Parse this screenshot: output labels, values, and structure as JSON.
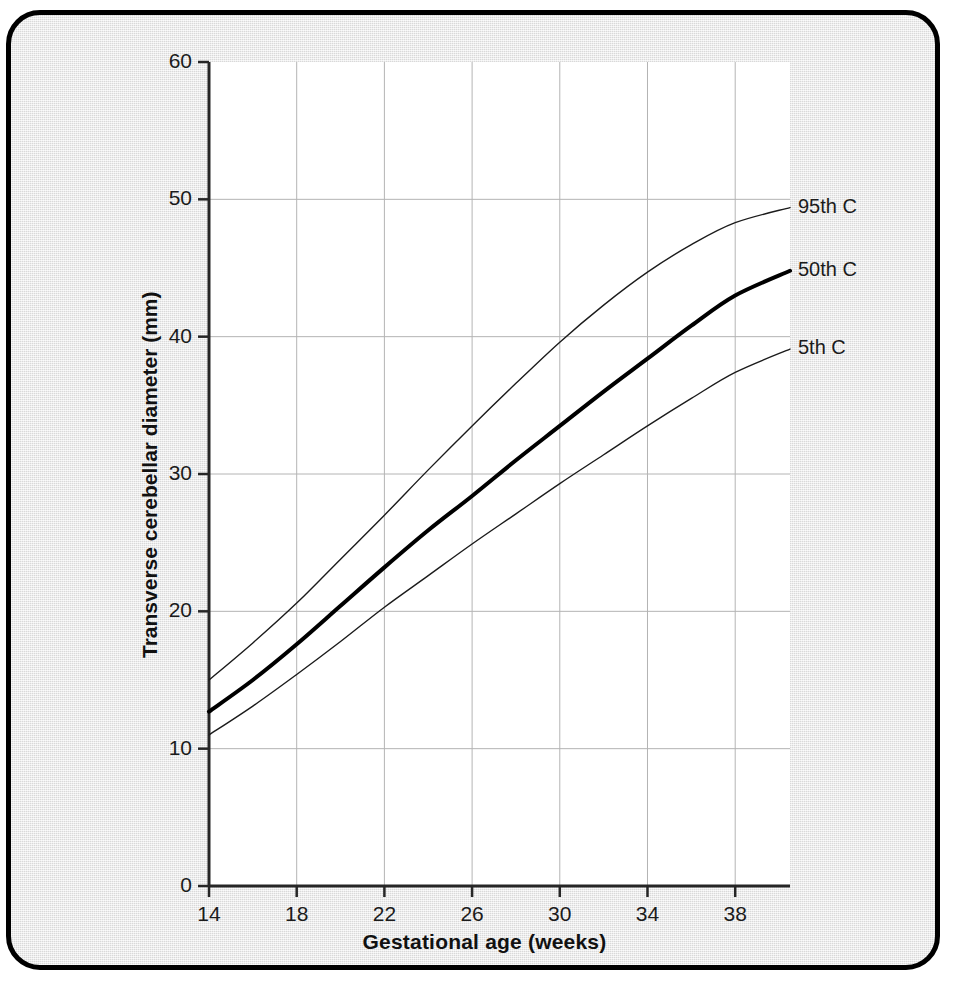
{
  "chart_data": {
    "type": "line",
    "title": "",
    "xlabel": "Gestational age (weeks)",
    "ylabel": "Transverse cerebellar diameter (mm)",
    "xlim": [
      14,
      40.5
    ],
    "ylim": [
      0,
      60
    ],
    "xticks": [
      14,
      18,
      22,
      26,
      30,
      34,
      38
    ],
    "yticks": [
      0,
      10,
      20,
      30,
      40,
      50,
      60
    ],
    "xtick_labels": [
      "14",
      "18",
      "22",
      "26",
      "30",
      "34",
      "38"
    ],
    "ytick_labels": [
      "0",
      "10",
      "20",
      "30",
      "40",
      "50",
      "60"
    ],
    "grid": true,
    "legend_position": "right-of-curve-ends",
    "x": [
      14,
      16,
      18,
      20,
      22,
      24,
      26,
      28,
      30,
      32,
      34,
      36,
      38,
      40.5
    ],
    "series": [
      {
        "name": "95th C",
        "label": "95th C",
        "color": "#1b1b1b",
        "linewidth": 1.4,
        "values": [
          15.0,
          17.7,
          20.6,
          23.8,
          27.0,
          30.3,
          33.5,
          36.6,
          39.6,
          42.3,
          44.7,
          46.7,
          48.3,
          49.4
        ]
      },
      {
        "name": "50th C",
        "label": "50th C",
        "color": "#000000",
        "linewidth": 4.0,
        "values": [
          12.7,
          15.0,
          17.6,
          20.4,
          23.2,
          25.9,
          28.4,
          31.0,
          33.5,
          36.0,
          38.4,
          40.8,
          43.0,
          44.8
        ]
      },
      {
        "name": "5th C",
        "label": "5th C",
        "color": "#1b1b1b",
        "linewidth": 1.4,
        "values": [
          11.0,
          13.1,
          15.4,
          17.8,
          20.3,
          22.6,
          24.9,
          27.1,
          29.3,
          31.4,
          33.5,
          35.5,
          37.4,
          39.1
        ]
      }
    ]
  },
  "axes": {
    "x_title": "Gestational age (weeks)",
    "y_title": "Transverse cerebellar diameter (mm)"
  },
  "labels": {
    "p95": "95th C",
    "p50": "50th C",
    "p5": "5th C"
  }
}
